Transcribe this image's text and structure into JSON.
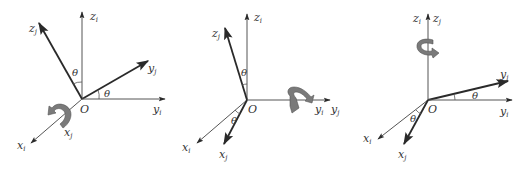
{
  "figure": {
    "panels": [
      {
        "id": "rot-x",
        "rotation_axis": "x",
        "origin_label": "O",
        "angle_label": "θ",
        "labels": {
          "zi": {
            "base": "z",
            "sub": "i"
          },
          "zj": {
            "base": "z",
            "sub": "j"
          },
          "yi": {
            "base": "y",
            "sub": "i"
          },
          "yj": {
            "base": "y",
            "sub": "j"
          },
          "xi": {
            "base": "x",
            "sub": "i"
          },
          "xj": {
            "base": "x",
            "sub": "j"
          }
        }
      },
      {
        "id": "rot-y",
        "rotation_axis": "y",
        "origin_label": "O",
        "angle_label": "θ",
        "labels": {
          "zi": {
            "base": "z",
            "sub": "i"
          },
          "zj": {
            "base": "z",
            "sub": "j"
          },
          "yi": {
            "base": "y",
            "sub": "i"
          },
          "yj": {
            "base": "y",
            "sub": "j"
          },
          "xi": {
            "base": "x",
            "sub": "i"
          },
          "xj": {
            "base": "x",
            "sub": "j"
          }
        }
      },
      {
        "id": "rot-z",
        "rotation_axis": "z",
        "origin_label": "O",
        "angle_label": "θ",
        "labels": {
          "zi": {
            "base": "z",
            "sub": "i"
          },
          "zj": {
            "base": "z",
            "sub": "j"
          },
          "yi": {
            "base": "y",
            "sub": "i"
          },
          "yj": {
            "base": "y",
            "sub": "j"
          },
          "xi": {
            "base": "x",
            "sub": "i"
          },
          "xj": {
            "base": "x",
            "sub": "j"
          }
        }
      }
    ],
    "colors": {
      "axis": "#555555",
      "axis_rotated": "#2a2a2a",
      "rotation_arrow": "#7a7a7a",
      "background": "#ffffff"
    }
  }
}
